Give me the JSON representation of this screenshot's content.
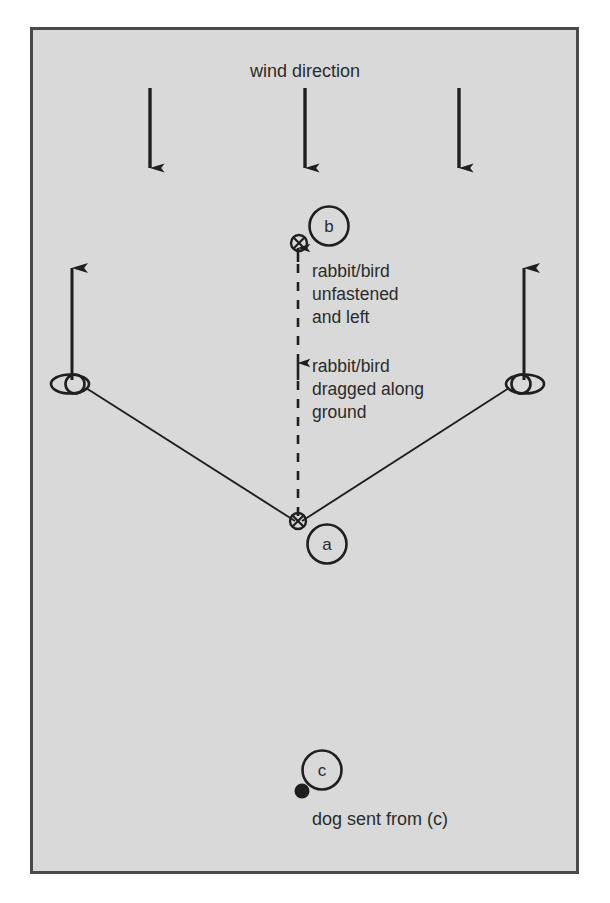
{
  "figure": {
    "frame": {
      "background_color": "#d9d9d9",
      "border_color": "#4a4a4a",
      "page_color": "#ffffff"
    },
    "ink_color": "#1f1f1f",
    "text_color": "#2b2b2b"
  },
  "wind": {
    "label": "wind direction",
    "arrow_count": 3,
    "direction": "down"
  },
  "annotations": {
    "upper": {
      "line1": "rabbit/bird",
      "line2": "unfastened",
      "line3": "and left"
    },
    "lower": {
      "line1": "rabbit/bird",
      "line2": "dragged along",
      "line3": "ground"
    }
  },
  "nodes": {
    "b": {
      "label": "b",
      "marker": "crossed-circle"
    },
    "a": {
      "label": "a",
      "marker": "crossed-circle"
    },
    "c": {
      "label": "c",
      "marker": "filled-dot"
    }
  },
  "caption": {
    "text": "dog sent from (c)"
  },
  "handlers": {
    "left": {
      "marker": "double-ellipse",
      "arrow": "up"
    },
    "right": {
      "marker": "double-ellipse",
      "arrow": "up"
    }
  },
  "paths": {
    "drag_path": "dashed vertical from a to b",
    "left_leg": "solid line from left handler to a",
    "right_leg": "solid line from right handler to a"
  }
}
